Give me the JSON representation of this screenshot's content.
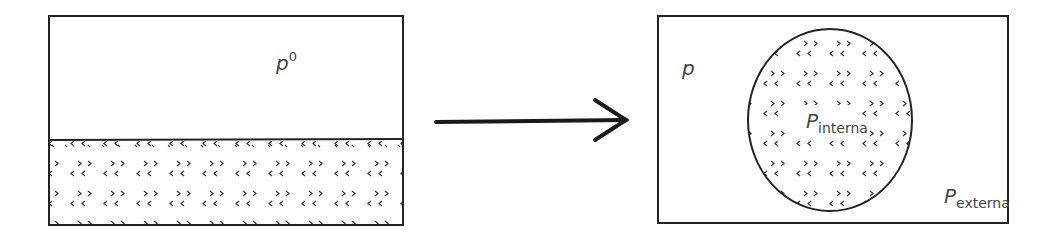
{
  "diagram": {
    "colors": {
      "stroke": "#222222",
      "text": "#444444",
      "background": "#ffffff",
      "dots": "#333333"
    },
    "left_panel": {
      "label_main": "p",
      "label_sup": "0",
      "fill_pattern": "dotted-chevrons",
      "region": "flat liquid layer at bottom"
    },
    "arrow": {
      "direction": "right"
    },
    "right_panel": {
      "outer_label": "p",
      "inner_label_main": "P",
      "inner_label_sub": "interna",
      "outer_pressure_main": "P",
      "outer_pressure_sub": "externa",
      "shape": "circle droplet with dotted-chevron fill"
    }
  }
}
